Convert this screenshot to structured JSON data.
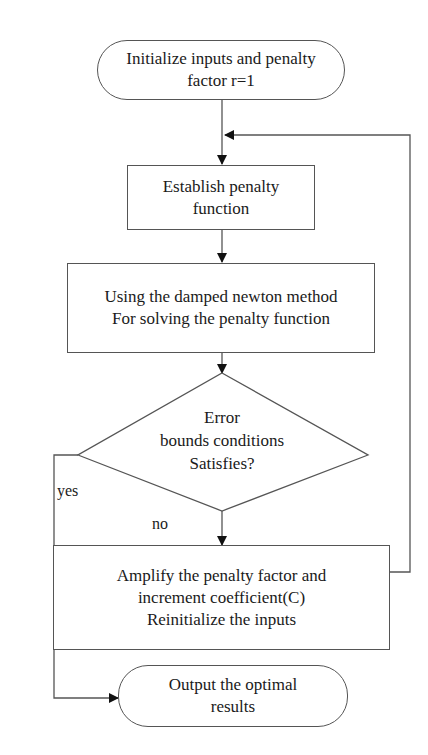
{
  "flowchart": {
    "nodes": {
      "start": {
        "type": "terminal",
        "lines": [
          "Initialize inputs and penalty",
          "factor r=1"
        ]
      },
      "establish": {
        "type": "process",
        "lines": [
          "Establish penalty",
          "function"
        ]
      },
      "solve": {
        "type": "process",
        "lines": [
          "Using the damped newton method",
          "For solving the penalty function"
        ]
      },
      "decision": {
        "type": "decision",
        "lines": [
          "Error",
          "bounds conditions",
          "Satisfies?"
        ]
      },
      "amplify": {
        "type": "process",
        "lines": [
          "Amplify the penalty factor and",
          "increment coefficient(C)",
          "Reinitialize the inputs"
        ]
      },
      "output": {
        "type": "terminal",
        "lines": [
          "Output the optimal",
          "results"
        ]
      }
    },
    "edge_labels": {
      "yes": "yes",
      "no": "no"
    },
    "edges": [
      {
        "from": "start",
        "to": "establish"
      },
      {
        "from": "establish",
        "to": "solve"
      },
      {
        "from": "solve",
        "to": "decision"
      },
      {
        "from": "decision",
        "to": "amplify",
        "label": "no"
      },
      {
        "from": "decision",
        "to": "output",
        "label": "yes"
      },
      {
        "from": "amplify",
        "to": "establish",
        "type": "loop-back"
      }
    ],
    "colors": {
      "line": "#555555",
      "arrow": "#111111",
      "text": "#1a1a1a",
      "background": "#ffffff"
    }
  }
}
